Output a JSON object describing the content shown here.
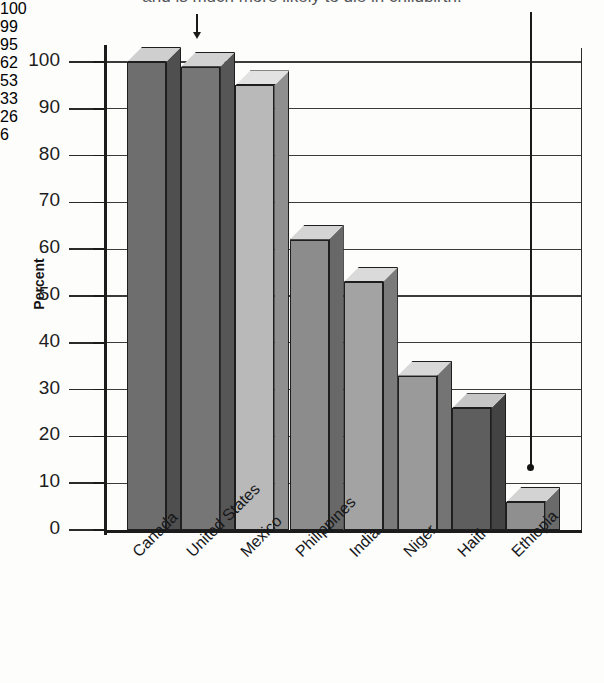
{
  "caption": "and is much more likely to die in childbirth.",
  "chart_data": {
    "type": "bar",
    "title": "",
    "xlabel": "",
    "ylabel": "Percent",
    "ylim": [
      0,
      100
    ],
    "ytick_labels": [
      "100",
      "90",
      "80",
      "70",
      "60",
      "50",
      "40",
      "30",
      "20",
      "10",
      "0"
    ],
    "ytick_values": [
      100,
      90,
      80,
      70,
      60,
      50,
      40,
      30,
      20,
      10,
      0
    ],
    "grid": true,
    "legend": "none",
    "style": "3d-grayscale-bars",
    "categories": [
      "Canada",
      "United States",
      "Mexico",
      "Philippines",
      "India",
      "Niger",
      "Haiti",
      "Ethiopia"
    ],
    "values": [
      100,
      99,
      95,
      62,
      53,
      33,
      26,
      6
    ],
    "data_labels": [
      "100",
      "99",
      "95",
      "62",
      "53",
      "33",
      "26",
      "6"
    ],
    "bar_colors": [
      "#6e6e6e",
      "#767676",
      "#b9b9b9",
      "#8c8c8c",
      "#a3a3a3",
      "#9a9a9a",
      "#5e5e5e",
      "#8f8f8f"
    ],
    "bar_top_colors": [
      "#cfcfcf",
      "#d2d2d2",
      "#e2e2e2",
      "#d4d4d4",
      "#dadada",
      "#d8d8d8",
      "#c6c6c6",
      "#d3d3d3"
    ],
    "bar_side_colors": [
      "#4f4f4f",
      "#565656",
      "#8f8f8f",
      "#686868",
      "#7b7b7b",
      "#747474",
      "#434343",
      "#6a6a6a"
    ],
    "annotations": [
      {
        "name": "arrow-united-states",
        "target": "United States",
        "style": "short-down-arrow"
      },
      {
        "name": "arrow-ethiopia",
        "target": "Ethiopia",
        "style": "long-down-line-with-dot"
      }
    ]
  }
}
